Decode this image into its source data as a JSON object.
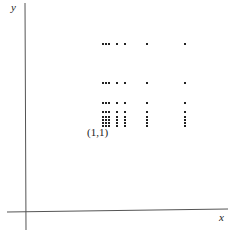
{
  "chart_data": {
    "type": "scatter",
    "title": "",
    "xlabel": "x",
    "ylabel": "y",
    "grid": false,
    "legend": null,
    "ticks": "none",
    "annotations": [
      {
        "text": "(1,1)",
        "at_point": [
          1,
          1
        ]
      }
    ],
    "x_levels": [
      1,
      2,
      3,
      4,
      5,
      6,
      7
    ],
    "y_levels": [
      1,
      2,
      3,
      4,
      5,
      6,
      7,
      8
    ],
    "x_pixel_positions": [
      103,
      106,
      109,
      117,
      125,
      147,
      185
    ],
    "y_pixel_positions": [
      126,
      123,
      120,
      117,
      112,
      103,
      83,
      44
    ],
    "points": "all combinations of x_levels × y_levels",
    "axis_origin_px": [
      25,
      212
    ],
    "marker": {
      "shape": "square-dot",
      "size": 2,
      "color": "#222222"
    },
    "axis_color": "#555555"
  },
  "labels": {
    "x_axis": "x",
    "y_axis": "y",
    "origin_point": "(1,1)"
  }
}
